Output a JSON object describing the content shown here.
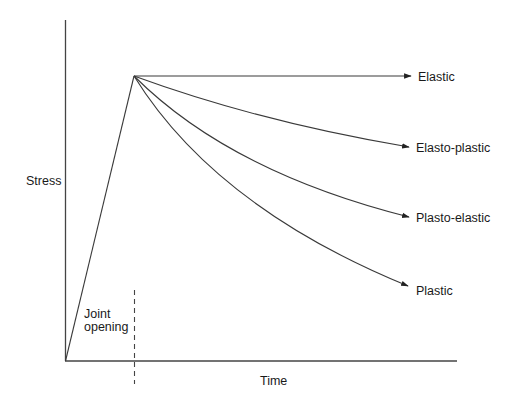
{
  "diagram": {
    "y_axis_label": "Stress",
    "x_axis_label": "Time",
    "annotation": {
      "line1": "Joint",
      "line2": "opening"
    },
    "curves": [
      {
        "label": "Elastic"
      },
      {
        "label": "Elasto-plastic"
      },
      {
        "label": "Plasto-elastic"
      },
      {
        "label": "Plastic"
      }
    ],
    "colors": {
      "line": "#3a3a3a",
      "text": "#1a1a1a",
      "background": "#ffffff"
    }
  }
}
